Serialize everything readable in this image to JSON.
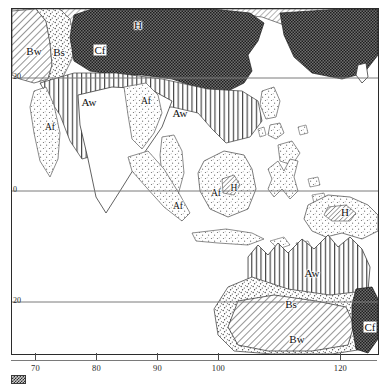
{
  "figure": {
    "kind": "koppen-climate-map",
    "region": "Southeast Asia, Indonesia, New Guinea and Australia"
  },
  "axes": {
    "x": {
      "ticks": [
        {
          "label": "70",
          "value": 70
        },
        {
          "label": "80",
          "value": 80
        },
        {
          "label": "90",
          "value": 90
        },
        {
          "label": "100",
          "value": 100
        },
        {
          "label": "120",
          "value": 120
        }
      ]
    },
    "y": {
      "ticks": [
        {
          "label": "20",
          "value": 20
        },
        {
          "label": "0",
          "value": 0
        },
        {
          "label": "20",
          "value": -20
        }
      ]
    }
  },
  "map_labels": [
    {
      "id": "bw-asia",
      "text": "Bw",
      "x": 22,
      "y": 42,
      "style": "plain"
    },
    {
      "id": "bs-asia",
      "text": "Bs",
      "x": 47,
      "y": 43,
      "style": "plain"
    },
    {
      "id": "cf-asia",
      "text": "Cf",
      "x": 88,
      "y": 41,
      "style": "boxed"
    },
    {
      "id": "h-himalaya",
      "text": "H",
      "x": 126,
      "y": 16,
      "style": "plain"
    },
    {
      "id": "aw-india",
      "text": "Aw",
      "x": 77,
      "y": 93,
      "style": "plain"
    },
    {
      "id": "af-myanmar",
      "text": "Af",
      "x": 38,
      "y": 119,
      "style": "small"
    },
    {
      "id": "af-indochina",
      "text": "Af",
      "x": 134,
      "y": 93,
      "style": "small"
    },
    {
      "id": "aw-indochina",
      "text": "Aw",
      "x": 168,
      "y": 104,
      "style": "plain"
    },
    {
      "id": "af-malaya",
      "text": "Af",
      "x": 166,
      "y": 198,
      "style": "small"
    },
    {
      "id": "af-borneo",
      "text": "Af",
      "x": 204,
      "y": 185,
      "style": "small"
    },
    {
      "id": "h-borneo",
      "text": "H",
      "x": 222,
      "y": 180,
      "style": "small"
    },
    {
      "id": "h-newguinea",
      "text": "H",
      "x": 333,
      "y": 203,
      "style": "plain"
    },
    {
      "id": "aw-australia",
      "text": "Aw",
      "x": 300,
      "y": 264,
      "style": "plain"
    },
    {
      "id": "bs-australia",
      "text": "Bs",
      "x": 279,
      "y": 295,
      "style": "plain"
    },
    {
      "id": "bw-australia",
      "text": "Bw",
      "x": 285,
      "y": 330,
      "style": "plain"
    },
    {
      "id": "cf-australia",
      "text": "Cf",
      "x": 358,
      "y": 318,
      "style": "boxed"
    }
  ],
  "legend": {
    "swatch_name": "hatched-sample-swatch",
    "caption": ""
  },
  "colors": {
    "ink": "#1a1a1a",
    "frame": "#2b2b2b",
    "graticule": "#7a7a7a",
    "coast": "#3a3a3a"
  }
}
